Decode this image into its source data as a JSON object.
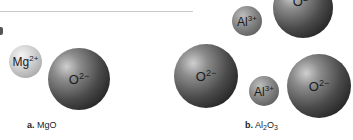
{
  "figure": {
    "panel_a": {
      "letter": "a.",
      "compound": "MgO",
      "ions": [
        {
          "symbol": "Mg",
          "charge": "2+",
          "type": "cation"
        },
        {
          "symbol": "O",
          "charge": "2−",
          "type": "anion"
        }
      ]
    },
    "panel_b": {
      "letter": "b.",
      "compound_parts": {
        "el1": "Al",
        "sub1": "2",
        "el2": "O",
        "sub2": "3"
      },
      "ions": [
        {
          "symbol": "Al",
          "charge": "3+",
          "type": "cation"
        },
        {
          "symbol": "O",
          "charge": "2−",
          "type": "anion"
        },
        {
          "symbol": "O",
          "charge": "2−",
          "type": "anion"
        },
        {
          "symbol": "Al",
          "charge": "3+",
          "type": "cation"
        },
        {
          "symbol": "O",
          "charge": "2−",
          "type": "anion"
        }
      ]
    },
    "colors": {
      "divider": "#c9c9c9",
      "cation_mg": "#c8c8c8",
      "cation_al": "#7a7a7a",
      "anion_o": "#333333",
      "text": "#222222"
    }
  }
}
